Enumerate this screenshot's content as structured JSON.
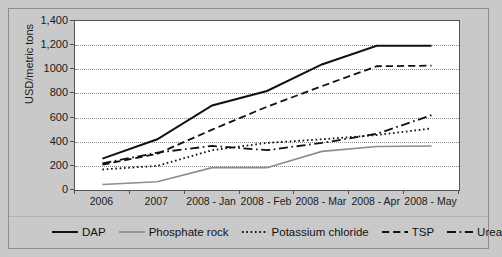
{
  "chart_data": {
    "type": "line",
    "title": "",
    "subtitle": "",
    "xlabel": "",
    "ylabel": "USD/metric tons",
    "categories": [
      "2006",
      "2007",
      "2008 - Jan",
      "2008 - Feb",
      "2008 - Mar",
      "2008 - Apr",
      "2008 - May"
    ],
    "ylim": [
      0,
      1400
    ],
    "ytick_labels": [
      "1,400",
      "1,200",
      "1000",
      "800",
      "600",
      "400",
      "200",
      "0"
    ],
    "ytick_values": [
      1400,
      1200,
      1000,
      800,
      600,
      400,
      200,
      0
    ],
    "grid": true,
    "grid_style": "dotted-horizontal",
    "legend_position": "bottom",
    "series": [
      {
        "name": "DAP",
        "values": [
          260,
          420,
          700,
          820,
          1040,
          1195,
          1195
        ],
        "style": "solid",
        "color": "#111111",
        "width": 2.0
      },
      {
        "name": "Phosphate rock",
        "values": [
          45,
          68,
          185,
          185,
          320,
          360,
          365
        ],
        "style": "solid",
        "color": "#8c8c8c",
        "width": 1.6
      },
      {
        "name": "Potassium chloride",
        "values": [
          170,
          200,
          330,
          390,
          420,
          455,
          510
        ],
        "style": "dotted",
        "color": "#111111",
        "width": 1.8
      },
      {
        "name": "TSP",
        "values": [
          210,
          300,
          500,
          690,
          860,
          1025,
          1030
        ],
        "style": "dashed",
        "color": "#111111",
        "width": 1.8
      },
      {
        "name": "Urea",
        "values": [
          220,
          310,
          365,
          330,
          390,
          465,
          620
        ],
        "style": "dashdot",
        "color": "#111111",
        "width": 1.8
      }
    ]
  },
  "legend": {
    "items": [
      {
        "label": "DAP"
      },
      {
        "label": "Phosphate rock"
      },
      {
        "label": "Potassium chloride"
      },
      {
        "label": "TSP"
      },
      {
        "label": "Urea"
      }
    ]
  }
}
